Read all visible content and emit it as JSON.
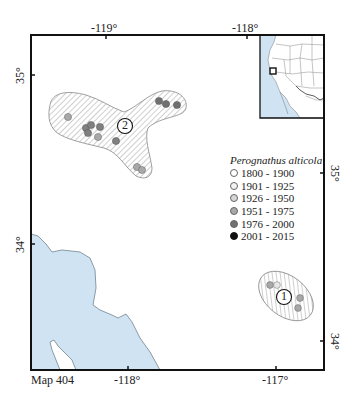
{
  "map": {
    "label": "Map 404",
    "colors": {
      "water": "#cfe3f3",
      "coast": "#8a9aa6",
      "frame": "#111111",
      "hatch": "#9a9a9a",
      "range_outline": "#888888"
    },
    "axes": {
      "top_ticks": [
        {
          "label": "-119°",
          "x": 106
        },
        {
          "label": "-118°",
          "x": 247
        }
      ],
      "bottom_ticks": [
        {
          "label": "-118°",
          "x": 128
        },
        {
          "label": "-117°",
          "x": 276
        }
      ],
      "left_ticks": [
        {
          "label": "35°",
          "y": 75
        },
        {
          "label": "34°",
          "y": 244
        }
      ],
      "right_ticks": [
        {
          "label": "35°",
          "y": 173
        },
        {
          "label": "34°",
          "y": 341
        }
      ]
    },
    "ranges": [
      {
        "id": "2",
        "label": "2",
        "label_x": 125,
        "label_y": 126
      },
      {
        "id": "1",
        "label": "1",
        "label_x": 284,
        "label_y": 297
      }
    ],
    "records": [
      {
        "range": "2",
        "x": 68,
        "y": 117,
        "period": "1951 - 1975"
      },
      {
        "range": "2",
        "x": 86,
        "y": 128,
        "period": "1976 - 2000"
      },
      {
        "range": "2",
        "x": 91,
        "y": 126,
        "period": "1976 - 2000"
      },
      {
        "range": "2",
        "x": 100,
        "y": 128,
        "period": "1976 - 2000"
      },
      {
        "range": "2",
        "x": 89,
        "y": 134,
        "period": "1976 - 2000"
      },
      {
        "range": "2",
        "x": 99,
        "y": 137,
        "period": "1951 - 1975"
      },
      {
        "range": "2",
        "x": 116,
        "y": 141,
        "period": "1976 - 2000"
      },
      {
        "range": "2",
        "x": 159,
        "y": 101,
        "period": "1976 - 2000"
      },
      {
        "range": "2",
        "x": 166,
        "y": 104,
        "period": "1976 - 2000"
      },
      {
        "range": "2",
        "x": 177,
        "y": 105,
        "period": "1976 - 2000"
      },
      {
        "range": "2",
        "x": 137,
        "y": 167,
        "period": "1951 - 1975"
      },
      {
        "range": "2",
        "x": 142,
        "y": 170,
        "period": "1951 - 1975"
      },
      {
        "range": "1",
        "x": 270,
        "y": 285,
        "period": "1951 - 1975"
      },
      {
        "range": "1",
        "x": 277,
        "y": 285,
        "period": "1926 - 1950"
      },
      {
        "range": "1",
        "x": 300,
        "y": 298,
        "period": "1951 - 1975"
      },
      {
        "range": "1",
        "x": 298,
        "y": 308,
        "period": "1951 - 1975"
      }
    ],
    "inset": {
      "name": "western-north-america-locator",
      "marker": "study-area-square"
    }
  },
  "legend": {
    "title": "Perognathus alticola",
    "items": [
      {
        "label": "1800 - 1900",
        "fill": "#ffffff"
      },
      {
        "label": "1901 - 1925",
        "fill": "#f2f2f2"
      },
      {
        "label": "1926 - 1950",
        "fill": "#d6d6d6"
      },
      {
        "label": "1951 - 1975",
        "fill": "#a8a8a8"
      },
      {
        "label": "1976 - 2000",
        "fill": "#707070"
      },
      {
        "label": "2001 - 2015",
        "fill": "#111111"
      }
    ]
  }
}
